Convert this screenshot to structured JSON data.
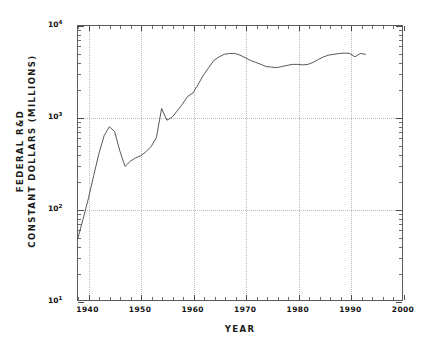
{
  "chart_data": {
    "type": "line",
    "title": "",
    "xlabel": "YEAR",
    "ylabel_lines": [
      "FEDERAL R&D",
      "CONSTANT DOLLARS (MILLIONS)"
    ],
    "ylabel": "FEDERAL R&D CONSTANT DOLLARS (MILLIONS)",
    "yscale": "log",
    "xscale": "linear",
    "xlim": [
      1938,
      2000
    ],
    "ylim": [
      10,
      10000
    ],
    "grid": true,
    "legend": null,
    "xticks": [
      1940,
      1950,
      1960,
      1970,
      1980,
      1990,
      2000
    ],
    "xtick_labels": [
      "1940",
      "1950",
      "1960",
      "1970",
      "1980",
      "1990",
      "2000"
    ],
    "yticks": [
      10,
      100,
      1000,
      10000
    ],
    "ytick_labels": [
      "10¹",
      "10²",
      "10³",
      "10⁴"
    ],
    "ytick_mantissa": "10",
    "ytick_exponents": [
      "1",
      "2",
      "3",
      "4"
    ],
    "line_color": "#444444",
    "x": [
      1938,
      1939,
      1940,
      1941,
      1942,
      1943,
      1944,
      1945,
      1946,
      1947,
      1948,
      1949,
      1950,
      1951,
      1952,
      1953,
      1954,
      1955,
      1956,
      1957,
      1958,
      1959,
      1960,
      1961,
      1962,
      1963,
      1964,
      1965,
      1966,
      1967,
      1968,
      1969,
      1970,
      1971,
      1972,
      1973,
      1974,
      1975,
      1976,
      1977,
      1978,
      1979,
      1980,
      1981,
      1982,
      1983,
      1984,
      1985,
      1986,
      1987,
      1988,
      1989,
      1990,
      1991,
      1992,
      1993
    ],
    "y": [
      48,
      78,
      130,
      230,
      400,
      630,
      790,
      700,
      430,
      290,
      330,
      360,
      380,
      420,
      480,
      600,
      1250,
      930,
      1000,
      1180,
      1400,
      1700,
      1850,
      2300,
      2900,
      3500,
      4200,
      4600,
      4900,
      5000,
      5000,
      4800,
      4500,
      4200,
      4000,
      3800,
      3600,
      3550,
      3500,
      3600,
      3700,
      3800,
      3800,
      3750,
      3800,
      4000,
      4300,
      4600,
      4800,
      4900,
      5000,
      5050,
      5000,
      4600,
      5000,
      4900
    ],
    "units": "millions of constant dollars",
    "n_points": 56,
    "series_name": "Federal R&D"
  },
  "figure": {
    "background_color": "#ffffff",
    "frame_color": "#5a5a5a",
    "grid_color": "#b9b9b9"
  }
}
